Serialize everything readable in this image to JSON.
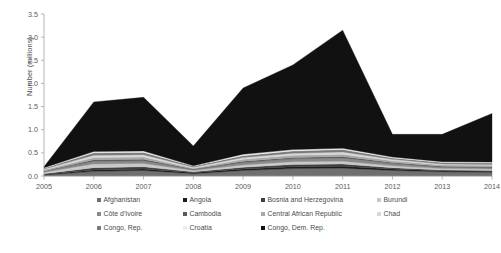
{
  "chart_data": {
    "type": "area",
    "stacked": true,
    "title": "",
    "xlabel": "",
    "ylabel": "Number (millions)",
    "x": [
      2005,
      2006,
      2007,
      2008,
      2009,
      2010,
      2011,
      2012,
      2013,
      2014
    ],
    "xtick_labels": [
      "2005",
      "2006",
      "2007",
      "2008",
      "2009",
      "2010",
      "2011",
      "2012",
      "2013",
      "2014"
    ],
    "ytick_labels": [
      "0.0",
      "0.5",
      "1.0",
      "1.5",
      "2.0",
      "2.5",
      "3.0",
      "3.5"
    ],
    "ytick_values": [
      0.0,
      0.5,
      1.0,
      1.5,
      2.0,
      2.5,
      3.0,
      3.5
    ],
    "ylim": [
      0.0,
      3.5
    ],
    "xlim": [
      2005,
      2014
    ],
    "grid": false,
    "legend_position": "bottom",
    "legend_columns": 4,
    "background": "#ffffff",
    "series": [
      {
        "name": "Afghanistan",
        "color": "#6f6f6f",
        "values": [
          0.02,
          0.1,
          0.12,
          0.05,
          0.12,
          0.16,
          0.17,
          0.12,
          0.09,
          0.08
        ]
      },
      {
        "name": "Angola",
        "color": "#1c1c1c",
        "values": [
          0.01,
          0.03,
          0.03,
          0.02,
          0.03,
          0.04,
          0.04,
          0.03,
          0.02,
          0.02
        ]
      },
      {
        "name": "Bosnia and Herzegovina",
        "color": "#3f3f3f",
        "values": [
          0.02,
          0.05,
          0.05,
          0.02,
          0.04,
          0.05,
          0.05,
          0.03,
          0.02,
          0.02
        ]
      },
      {
        "name": "Burundi",
        "color": "#c9c9c9",
        "values": [
          0.03,
          0.08,
          0.07,
          0.03,
          0.05,
          0.06,
          0.06,
          0.04,
          0.03,
          0.03
        ]
      },
      {
        "name": "Côte d'Ivoire",
        "color": "#8a8a8a",
        "values": [
          0.02,
          0.06,
          0.06,
          0.02,
          0.05,
          0.06,
          0.07,
          0.05,
          0.03,
          0.03
        ]
      },
      {
        "name": "Cambodia",
        "color": "#5a5a5a",
        "values": [
          0.01,
          0.03,
          0.03,
          0.01,
          0.03,
          0.03,
          0.03,
          0.02,
          0.02,
          0.02
        ]
      },
      {
        "name": "Central African Republic",
        "color": "#a8a8a8",
        "values": [
          0.02,
          0.05,
          0.05,
          0.02,
          0.04,
          0.05,
          0.05,
          0.04,
          0.03,
          0.03
        ]
      },
      {
        "name": "Chad",
        "color": "#d8d8d8",
        "values": [
          0.02,
          0.05,
          0.05,
          0.02,
          0.04,
          0.04,
          0.05,
          0.03,
          0.02,
          0.02
        ]
      },
      {
        "name": "Congo, Rep.",
        "color": "#7a7a7a",
        "values": [
          0.02,
          0.05,
          0.05,
          0.02,
          0.04,
          0.05,
          0.05,
          0.03,
          0.03,
          0.03
        ]
      },
      {
        "name": "Croatia",
        "color": "#ededed",
        "values": [
          0.01,
          0.03,
          0.03,
          0.01,
          0.03,
          0.03,
          0.03,
          0.02,
          0.02,
          0.02
        ]
      },
      {
        "name": "Congo, Dem. Rep.",
        "color": "#111111",
        "values": [
          0.02,
          1.07,
          1.16,
          0.43,
          1.43,
          1.83,
          2.55,
          0.49,
          0.59,
          1.05
        ]
      }
    ],
    "totals": [
      0.2,
      1.6,
      1.7,
      0.65,
      1.9,
      2.4,
      3.15,
      0.9,
      0.9,
      1.35
    ],
    "peak": {
      "year": 2011,
      "value": 3.15
    },
    "trough": {
      "year": 2008,
      "value": 0.65
    }
  },
  "axes": {
    "ylabel": "Number (millions)"
  }
}
